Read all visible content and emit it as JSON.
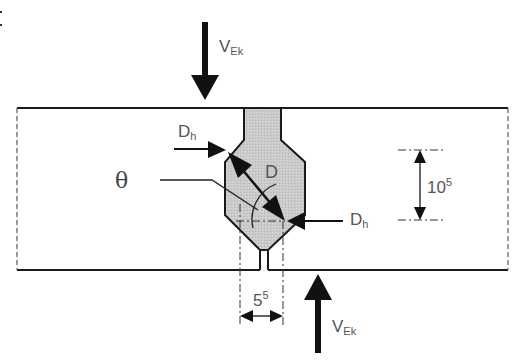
{
  "diagram": {
    "colors": {
      "line": "#1a1a1a",
      "weld_fill": "#c8c8c8",
      "label": "#555555",
      "background": "#ffffff"
    },
    "labels": {
      "force_top": {
        "main": "V",
        "sub": "Ek"
      },
      "force_bottom": {
        "main": "V",
        "sub": "Ek"
      },
      "dh_left": {
        "main": "D",
        "sub": "h"
      },
      "dh_right": {
        "main": "D",
        "sub": "h"
      },
      "diameter": "D",
      "angle": "θ",
      "dim_height": {
        "main": "10",
        "sup": "5"
      },
      "dim_width": {
        "main": "5",
        "sup": "5"
      }
    },
    "legend_marker": ":"
  }
}
